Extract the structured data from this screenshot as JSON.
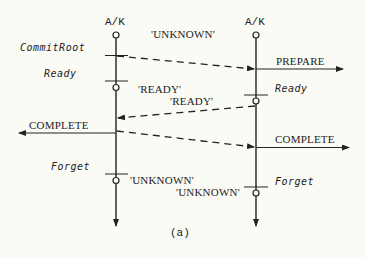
{
  "diagram": {
    "caption": "(a)",
    "participants": [
      {
        "id": "left",
        "label": "A/K"
      },
      {
        "id": "right",
        "label": "A/K"
      }
    ],
    "left_states": {
      "commit_root": "CommitRoot",
      "ready": "Ready",
      "forget": "Forget"
    },
    "right_states": {
      "ready": "Ready",
      "forget": "Forget"
    },
    "messages": {
      "unknown_top": "'UNKNOWN'",
      "ready_left": "'READY'",
      "ready_right": "'READY'",
      "unknown_left": "'UNKNOWN'",
      "unknown_right": "'UNKNOWN'",
      "prepare": "PREPARE",
      "complete_left": "COMPLETE",
      "complete_right": "COMPLETE"
    },
    "colors": {
      "ink": "#222222",
      "background": "#fbfbf6"
    }
  }
}
